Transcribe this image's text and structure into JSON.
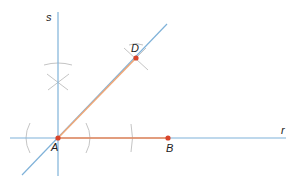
{
  "diagram": {
    "colors": {
      "axis_line": "#7fb2d9",
      "segment": "#f0a878",
      "segment_base": "#ee8a5a",
      "point": "#d9452b",
      "arc": "#b8b8b8",
      "label": "#222222"
    },
    "labels": {
      "line_s": "s",
      "line_r": "r",
      "point_a": "A",
      "point_b": "B",
      "point_d": "D"
    },
    "points": {
      "A": {
        "x": 58,
        "y": 138
      },
      "B": {
        "x": 168,
        "y": 138
      },
      "D": {
        "x": 136,
        "y": 58
      }
    },
    "lines": [
      {
        "name": "s",
        "type": "vertical",
        "through": "A"
      },
      {
        "name": "r",
        "type": "horizontal",
        "through": "A"
      },
      {
        "name": "bisector",
        "type": "diagonal",
        "through": [
          "A",
          "D"
        ]
      }
    ],
    "segments": [
      {
        "from": "A",
        "to": "B"
      },
      {
        "from": "A",
        "to": "D"
      }
    ]
  }
}
